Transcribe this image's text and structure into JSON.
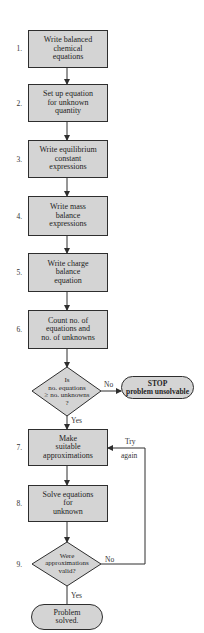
{
  "flowchart": {
    "steps": [
      {
        "num": "1.",
        "text": "Write balanced\nchemical\nequations"
      },
      {
        "num": "2.",
        "text": "Set up equation\nfor unknown\nquantity"
      },
      {
        "num": "3.",
        "text": "Write equilibrium\nconstant\nexpressions"
      },
      {
        "num": "4.",
        "text": "Write mass\nbalance\nexpressions"
      },
      {
        "num": "5.",
        "text": "Write charge\nbalance\nequation"
      },
      {
        "num": "6.",
        "text": "Count no. of\nequations and\nno. of unknowns"
      },
      {
        "num": "7.",
        "text": "Make\nsuitable\napproximations"
      },
      {
        "num": "8.",
        "text": "Solve equations\nfor\nunknown"
      },
      {
        "num": "9.",
        "text": "Were\napproximations\nvalid?"
      }
    ],
    "decision_1": {
      "text": "Is\nno. equations\n≥ no. unknowns\n?",
      "no_label": "No",
      "yes_label": "Yes"
    },
    "stop": {
      "title": "STOP",
      "subtitle": "problem unsolvable"
    },
    "decision_2": {
      "no_label": "No",
      "yes_label": "Yes"
    },
    "loop_label": {
      "line1": "Try",
      "line2": "again"
    },
    "end": {
      "text": "Problem\nsolved."
    }
  },
  "colors": {
    "fill": "#d4d4d4",
    "stroke": "#2e2e2e",
    "background": "#ffffff"
  }
}
